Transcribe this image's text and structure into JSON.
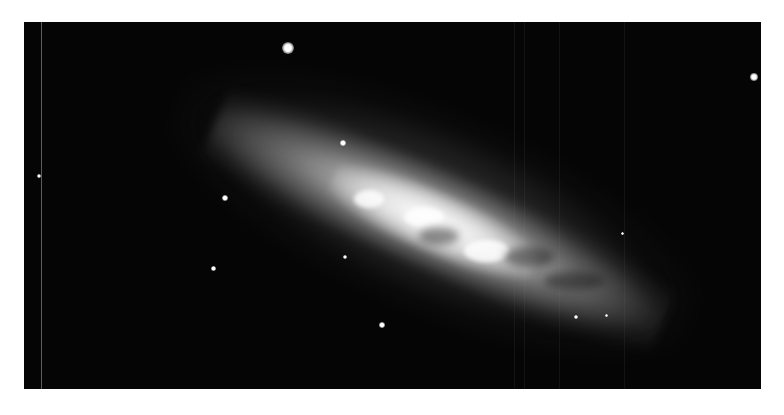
{
  "image": {
    "subject": "edge-on starburst galaxy on black sky with foreground stars",
    "background_color": "#ffffff",
    "frame_color": "#050505"
  },
  "stars": [
    {
      "x": 288,
      "y": 48,
      "r": 6
    },
    {
      "x": 754,
      "y": 77,
      "r": 4
    },
    {
      "x": 343,
      "y": 143,
      "r": 3
    },
    {
      "x": 39,
      "y": 176,
      "r": 2
    },
    {
      "x": 225,
      "y": 198,
      "r": 3
    },
    {
      "x": 213,
      "y": 268,
      "r": 2.5
    },
    {
      "x": 345,
      "y": 257,
      "r": 2
    },
    {
      "x": 382,
      "y": 325,
      "r": 3
    },
    {
      "x": 576,
      "y": 317,
      "r": 2
    },
    {
      "x": 606,
      "y": 315,
      "r": 1.5
    },
    {
      "x": 622,
      "y": 233,
      "r": 1.5
    }
  ]
}
